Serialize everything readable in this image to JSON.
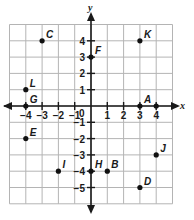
{
  "diagram": {
    "type": "coordinate-plane",
    "axes": {
      "x_label": "x",
      "y_label": "y",
      "origin_label": "0"
    },
    "x_ticks": [
      "−4",
      "−3",
      "−2",
      "−1",
      "1",
      "2",
      "3",
      "4"
    ],
    "x_tick_values": [
      -4,
      -3,
      -2,
      -1,
      1,
      2,
      3,
      4
    ],
    "y_ticks": [
      "4",
      "3",
      "2",
      "1",
      "−1",
      "−2",
      "−3",
      "−4",
      "−5"
    ],
    "y_tick_values": [
      4,
      3,
      2,
      1,
      -1,
      -2,
      -3,
      -4,
      -5
    ],
    "grid": {
      "x_range": [
        -5,
        5
      ],
      "y_range": [
        -6,
        5
      ]
    },
    "points": [
      {
        "label": "A",
        "x": 3,
        "y": 0
      },
      {
        "label": "B",
        "x": 1,
        "y": -4
      },
      {
        "label": "C",
        "x": -3,
        "y": 4
      },
      {
        "label": "D",
        "x": 3,
        "y": -5
      },
      {
        "label": "E",
        "x": -4,
        "y": -2
      },
      {
        "label": "F",
        "x": 0,
        "y": 3
      },
      {
        "label": "G",
        "x": -4,
        "y": 0
      },
      {
        "label": "H",
        "x": 0,
        "y": -4
      },
      {
        "label": "I",
        "x": -2,
        "y": -4
      },
      {
        "label": "J",
        "x": 4,
        "y": -3
      },
      {
        "label": "K",
        "x": 3,
        "y": 4
      },
      {
        "label": "L",
        "x": -4,
        "y": 1
      },
      {
        "label": "",
        "x": 4,
        "y": 0
      }
    ],
    "colors": {
      "grid": "#b4b4b4",
      "axis": "#1a1a1a",
      "point": "#111111"
    }
  }
}
